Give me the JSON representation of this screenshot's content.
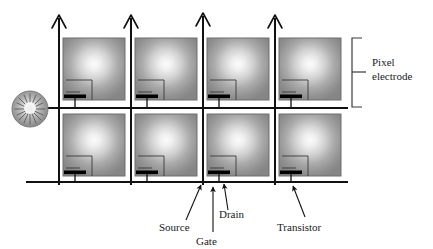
{
  "diagram": {
    "type": "schematic",
    "background_color": "#ffffff",
    "line_color": "#111111",
    "grid": {
      "columns": 4,
      "rows": 2,
      "cell_width": 72,
      "cell_height": 70,
      "origin_x": 59,
      "origin_y": 37,
      "pixel_fill_center": "#f2f2f2",
      "pixel_fill_edge": "#8d8d8d",
      "pixel_border_color": "#6f6f6f"
    },
    "data_lines": {
      "name": "vertical-data-lines",
      "count": 4,
      "x_positions": [
        59,
        131,
        203,
        275
      ],
      "top_y": 14,
      "bottom_y": 185,
      "arrow_head": "open-v",
      "stroke_width": 2
    },
    "gate_lines": {
      "name": "horizontal-gate-lines",
      "count": 2,
      "y_positions": [
        108,
        182
      ],
      "left_x": 26,
      "right_x": 348,
      "stroke_width": 2
    },
    "transistors": {
      "count": 8,
      "gate_bar_color": "#000000",
      "description": "thin-film transistor at lower-left of each pixel electrode"
    },
    "light_source": {
      "name": "backlight-source",
      "shape": "circle-with-rays",
      "center_x": 30,
      "center_y": 109,
      "radius": 18,
      "fill_center": "#f4f4f4",
      "fill_edge": "#8a8a8a",
      "ray_count": 16
    }
  },
  "annotations": {
    "pixel_electrode": {
      "label_line1": "Pixel",
      "label_line2": "electrode",
      "bracket": {
        "x": 352,
        "top_y": 38,
        "bottom_y": 107,
        "tick_x": 366,
        "tick_y": 72
      },
      "text_x": 372,
      "text_y": 66
    },
    "source": {
      "label": "Source",
      "text_x": 159,
      "text_y": 229,
      "arrow_tip_x": 201,
      "arrow_tip_y": 183,
      "arrow_tail_x": 186,
      "arrow_tail_y": 220
    },
    "gate": {
      "label": "Gate",
      "text_x": 198,
      "text_y": 243,
      "arrow_tip_x": 213,
      "arrow_tip_y": 186,
      "arrow_tail_x": 213,
      "arrow_tail_y": 234
    },
    "drain": {
      "label": "Drain",
      "text_x": 221,
      "text_y": 218,
      "arrow_tip_x": 224,
      "arrow_tip_y": 182,
      "arrow_tail_x": 230,
      "arrow_tail_y": 210
    },
    "transistor": {
      "label": "Transistor",
      "text_x": 277,
      "text_y": 229,
      "arrow_tip_x": 293,
      "arrow_tip_y": 184,
      "arrow_tail_x": 305,
      "arrow_tail_y": 218
    }
  }
}
